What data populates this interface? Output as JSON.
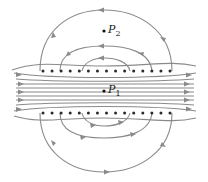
{
  "figure": {
    "wire_rows": [
      {
        "name": "top-row",
        "y": 71,
        "count": 15,
        "x_start": 43,
        "x_end": 170,
        "symbol": "dot"
      },
      {
        "name": "bottom-row",
        "y": 113,
        "count": 15,
        "x_start": 43,
        "x_end": 170,
        "symbol": "dot"
      }
    ],
    "points": [
      {
        "id": "P2",
        "label": "P",
        "subscript": "2",
        "x": 104,
        "y": 31
      },
      {
        "id": "P1",
        "label": "P",
        "subscript": "1",
        "x": 104,
        "y": 91
      }
    ],
    "interior_field_direction": "left-to-right",
    "colors": {
      "field_line": "#8a8a8a",
      "wire": "#2a2a2a",
      "label": "#1a1a1a",
      "background": "#ffffff"
    }
  }
}
